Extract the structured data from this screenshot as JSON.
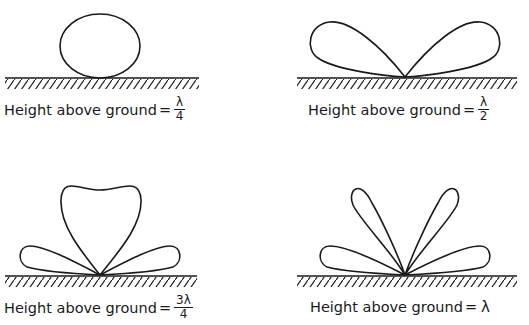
{
  "panels": [
    {
      "id": "quarter",
      "label": "Height above ground",
      "eq": "=",
      "numerator": "λ",
      "denominator": "4",
      "height_wavelengths": 0.25,
      "lobes": 1
    },
    {
      "id": "half",
      "label": "Height above ground",
      "eq": "=",
      "numerator": "λ",
      "denominator": "2",
      "height_wavelengths": 0.5,
      "lobes": 2
    },
    {
      "id": "three-quarter",
      "label": "Height above ground",
      "eq": "=",
      "numerator": "3λ",
      "denominator": "4",
      "height_wavelengths": 0.75,
      "lobes": 3
    },
    {
      "id": "full",
      "label": "Height above ground",
      "eq": "=",
      "value": "λ",
      "height_wavelengths": 1.0,
      "lobes": 4
    }
  ],
  "colors": {
    "ink": "#1a1a1a",
    "background": "#ffffff"
  }
}
